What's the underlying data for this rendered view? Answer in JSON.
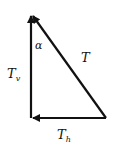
{
  "diagram": {
    "type": "vector-triangle",
    "labels": {
      "hypotenuse": "T",
      "vertical_main": "T",
      "vertical_sub": "v",
      "horizontal_main": "T",
      "horizontal_sub": "h",
      "angle": "α"
    },
    "colors": {
      "line": "#111111",
      "background": "#ffffff"
    }
  }
}
